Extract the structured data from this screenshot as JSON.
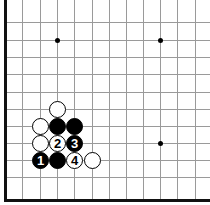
{
  "board": {
    "type": "go-board-corner-diagram",
    "colors": {
      "line": "#9a9a9a",
      "edge": "#111111",
      "black": "#000000",
      "white": "#ffffff"
    },
    "x_lines": [
      22,
      40,
      57,
      74,
      92,
      109,
      126,
      143,
      160,
      177,
      195
    ],
    "y_lines": [
      22,
      40,
      57,
      74,
      92,
      109,
      126,
      143,
      160,
      177
    ],
    "left_edge_x": 5,
    "bottom_edge_y": 200,
    "star_points": [
      {
        "x": 57,
        "y": 40
      },
      {
        "x": 160,
        "y": 40
      },
      {
        "x": 160,
        "y": 143
      }
    ],
    "stones": [
      {
        "color": "white",
        "x": 57,
        "y": 109,
        "label": ""
      },
      {
        "color": "white",
        "x": 40,
        "y": 126,
        "label": ""
      },
      {
        "color": "black",
        "x": 57,
        "y": 126,
        "label": ""
      },
      {
        "color": "black",
        "x": 74,
        "y": 126,
        "label": ""
      },
      {
        "color": "white",
        "x": 40,
        "y": 143,
        "label": ""
      },
      {
        "color": "white",
        "x": 57,
        "y": 143,
        "label": "2"
      },
      {
        "color": "black",
        "x": 74,
        "y": 143,
        "label": "3"
      },
      {
        "color": "black",
        "x": 40,
        "y": 160,
        "label": "1"
      },
      {
        "color": "black",
        "x": 57,
        "y": 160,
        "label": ""
      },
      {
        "color": "white",
        "x": 74,
        "y": 160,
        "label": "4"
      },
      {
        "color": "white",
        "x": 92,
        "y": 160,
        "label": ""
      }
    ]
  }
}
